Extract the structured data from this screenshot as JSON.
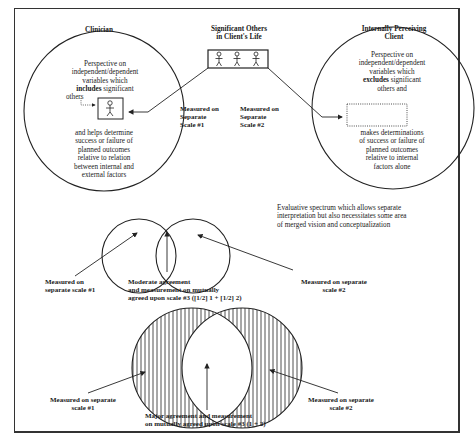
{
  "diagram": {
    "top": {
      "clinician": {
        "title": "Clinician",
        "text_before": [
          "Perspective on",
          "independent/dependent",
          "variables which"
        ],
        "includes_bold": "includes",
        "includes_rest": " significant",
        "others": "others",
        "text_after": [
          "and helps determine",
          "success or failure of",
          "planned outcomes",
          "relative to relation",
          "between internal and",
          "external factors"
        ]
      },
      "significant_others": {
        "title_line1": "Significant Others",
        "title_line2": "in Client's Life",
        "figure_count": 3
      },
      "client": {
        "title_line1": "Internally Perceiving",
        "title_line2": "Client",
        "text_before": [
          "Perspective on",
          "independent/dependent",
          "variables which"
        ],
        "excludes_bold": "excludes",
        "excludes_rest": " significant",
        "others_and": "others and",
        "text_after": [
          "makes determinations",
          "of success or failure of",
          "planned outcomes",
          "relative to internal",
          "factors alone"
        ]
      },
      "scale1_label": [
        "Measured on",
        "Separate",
        "Scale #1"
      ],
      "scale2_label": [
        "Measured on",
        "Separate",
        "Scale #2"
      ]
    },
    "middle": {
      "description": [
        "Evaluative spectrum which allows separate",
        "interpretation but also necessitates some area",
        "of merged vision and conceptualization"
      ],
      "left_label": [
        "Measured on",
        "separate scale #1"
      ],
      "center_label": [
        "Moderate agreement",
        "and measurement on mutually",
        "agreed upon scale #3 ([1/2] 1 + [1/2] 2)"
      ],
      "right_label": [
        "Measured on separate",
        "scale #2"
      ]
    },
    "bottom": {
      "left_label": [
        "Measured on separate",
        "scale #1"
      ],
      "center_label": [
        "Major agreement and measurement",
        "on mutually agreed upon scale #3 (1 + 2)"
      ],
      "right_label": [
        "Measured on separate",
        "scale #2"
      ]
    }
  }
}
